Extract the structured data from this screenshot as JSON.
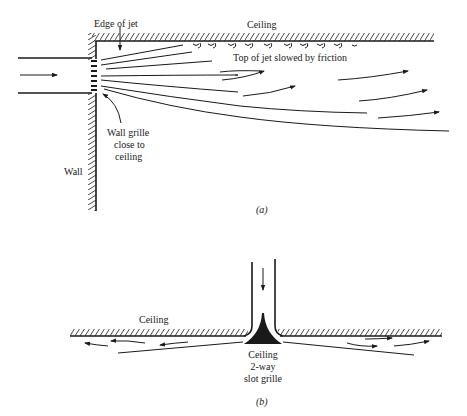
{
  "figure_a": {
    "caption": "(a)",
    "labels": {
      "edge_of_jet": "Edge of jet",
      "ceiling": "Ceiling",
      "top_of_jet": "Top of jet slowed by friction",
      "wall_grille_line1": "Wall grille",
      "wall_grille_line2": "close to",
      "wall_grille_line3": "ceiling",
      "wall": "Wall"
    }
  },
  "figure_b": {
    "caption": "(b)",
    "labels": {
      "ceiling": "Ceiling",
      "grille_line1": "Ceiling",
      "grille_line2": "2-way",
      "grille_line3": "slot grille"
    }
  },
  "colors": {
    "ink": "#1a1a1a",
    "background": "#ffffff"
  }
}
